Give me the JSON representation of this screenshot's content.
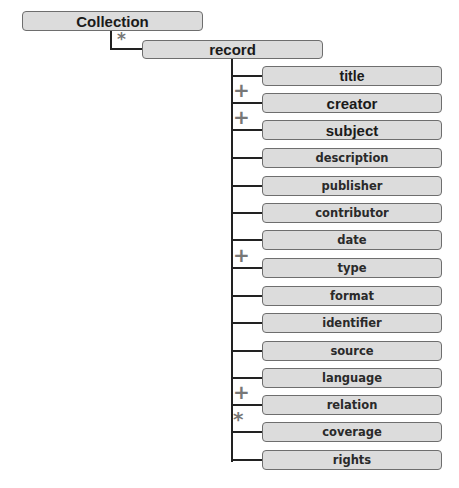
{
  "root": {
    "label": "Collection"
  },
  "record": {
    "label": "record",
    "cardinality": "*"
  },
  "elements": [
    {
      "label": "title",
      "cardinality": ""
    },
    {
      "label": "creator",
      "cardinality": "+"
    },
    {
      "label": "subject",
      "cardinality": "+"
    },
    {
      "label": "description",
      "cardinality": ""
    },
    {
      "label": "publisher",
      "cardinality": ""
    },
    {
      "label": "contributor",
      "cardinality": ""
    },
    {
      "label": "date",
      "cardinality": ""
    },
    {
      "label": "type",
      "cardinality": "+"
    },
    {
      "label": "format",
      "cardinality": ""
    },
    {
      "label": "identifier",
      "cardinality": ""
    },
    {
      "label": "source",
      "cardinality": ""
    },
    {
      "label": "language",
      "cardinality": ""
    },
    {
      "label": "relation",
      "cardinality": "+"
    },
    {
      "label": "coverage",
      "cardinality": "*"
    },
    {
      "label": "rights",
      "cardinality": ""
    }
  ]
}
